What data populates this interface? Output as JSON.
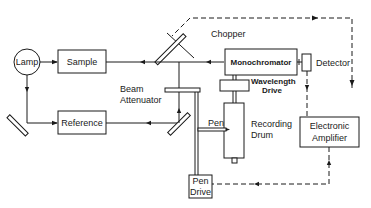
{
  "diagram": {
    "type": "block-diagram",
    "title": "",
    "components": {
      "lamp": "Lamp",
      "sample": "Sample",
      "reference": "Reference",
      "chopper": "Chopper",
      "beam_attenuator_1": "Beam",
      "beam_attenuator_2": "Attenuator",
      "monochromator": "Monochromator",
      "detector": "Detector",
      "wavelength_drive_1": "Wavelength",
      "wavelength_drive_2": "Drive",
      "pen": "Pen",
      "recording_drum_1": "Recording",
      "recording_drum_2": "Drum",
      "electronic_amplifier_1": "Electronic",
      "electronic_amplifier_2": "Amplifier",
      "pen_drive_1": "Pen",
      "pen_drive_2": "Drive"
    },
    "connections": [
      {
        "from": "Lamp",
        "to": "Sample",
        "style": "solid"
      },
      {
        "from": "Lamp",
        "to": "Reference",
        "style": "solid",
        "via": "mirror"
      },
      {
        "from": "Sample",
        "to": "Chopper",
        "style": "solid"
      },
      {
        "from": "Reference",
        "to": "Beam Attenuator",
        "style": "solid",
        "via": "mirror"
      },
      {
        "from": "Chopper",
        "to": "Monochromator",
        "style": "solid"
      },
      {
        "from": "Monochromator",
        "to": "Detector",
        "style": "solid"
      },
      {
        "from": "Detector",
        "to": "Electronic Amplifier",
        "style": "dashed"
      },
      {
        "from": "Electronic Amplifier",
        "to": "Chopper",
        "style": "dashed"
      },
      {
        "from": "Electronic Amplifier",
        "to": "Pen Drive",
        "style": "dashed"
      },
      {
        "from": "Pen Drive",
        "to": "Beam Attenuator",
        "style": "mechanical"
      },
      {
        "from": "Wavelength Drive",
        "to": "Monochromator",
        "style": "mechanical"
      },
      {
        "from": "Wavelength Drive",
        "to": "Recording Drum",
        "style": "mechanical"
      }
    ]
  }
}
